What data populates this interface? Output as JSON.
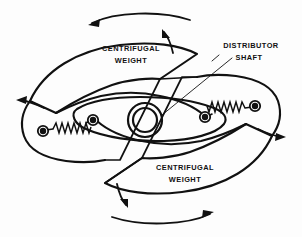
{
  "figure": {
    "background_color": "#fdfdfd",
    "line_color": "#111111"
  },
  "labels": {
    "weight_top_line1": "CENTRIFUGAL",
    "weight_top_line2": "WEIGHT",
    "weight_bottom_line1": "CENTRIFUGAL",
    "weight_bottom_line2": "WEIGHT",
    "shaft_line1": "DISTRIBUTOR",
    "shaft_line2": "SHAFT"
  },
  "parts": {
    "hub": {
      "name": "distributor-shaft-hub",
      "center_x": 145,
      "center_y": 120,
      "outer_radius": 17,
      "inner_radius": 12
    },
    "springs": [
      {
        "name": "left-spring",
        "start_x": 45,
        "start_y": 131,
        "end_x": 84,
        "end_y": 122
      },
      {
        "name": "right-spring",
        "start_x": 247,
        "start_y": 107,
        "end_x": 209,
        "end_y": 116
      }
    ],
    "pivots": [
      {
        "name": "left-outer-pivot",
        "x": 43,
        "y": 131,
        "radius": 4.6
      },
      {
        "name": "left-inner-pivot",
        "x": 92,
        "y": 120,
        "radius": 4.6
      },
      {
        "name": "right-outer-pivot",
        "x": 255,
        "y": 106,
        "radius": 4.6
      },
      {
        "name": "right-inner-pivot",
        "x": 206,
        "y": 117,
        "radius": 4.6
      }
    ]
  },
  "rotation_arrows": [
    {
      "name": "rotation-arrow-top",
      "direction": "left"
    },
    {
      "name": "rotation-arrow-top-inner",
      "direction": "up"
    },
    {
      "name": "rotation-arrow-left",
      "direction": "left"
    },
    {
      "name": "rotation-arrow-right",
      "direction": "right"
    },
    {
      "name": "rotation-arrow-bottom-inner",
      "direction": "down"
    },
    {
      "name": "rotation-arrow-bottom",
      "direction": "right"
    }
  ]
}
